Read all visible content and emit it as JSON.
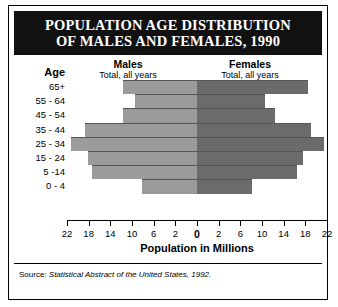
{
  "title": {
    "line1": "POPULATION AGE DISTRIBUTION",
    "line2": "OF MALES AND FEMALES, 1990"
  },
  "headers": {
    "age": "Age",
    "males": {
      "title": "Males",
      "subtitle": "Total, all years",
      "value": "121,239"
    },
    "females": {
      "title": "Females",
      "subtitle": "Total, all years",
      "value": "127,470"
    }
  },
  "axis": {
    "title": "Population in Millions",
    "tick_labels": [
      "22",
      "18",
      "14",
      "10",
      "6",
      "2",
      "0",
      "2",
      "6",
      "10",
      "14",
      "18",
      "22"
    ]
  },
  "source": {
    "prefix": "Source: ",
    "italic": "Statistical Abstract of the United States, 1992."
  },
  "colors": {
    "male_bar": "#9b9b9b",
    "female_bar": "#6b6b6b",
    "banner": "#111111",
    "frame": "#000000"
  },
  "chart_data": {
    "type": "bar",
    "title": "POPULATION AGE DISTRIBUTION OF MALES AND FEMALES, 1990",
    "xlabel": "Population in Millions",
    "ylabel": "Age",
    "orientation": "horizontal-diverging",
    "xlim": [
      -22,
      22
    ],
    "xticks": [
      22,
      18,
      14,
      10,
      6,
      2,
      0,
      2,
      6,
      10,
      14,
      18,
      22
    ],
    "grid": false,
    "legend_position": "top",
    "categories": [
      "65+",
      "55 - 64",
      "45 - 54",
      "35 - 44",
      "25 - 34",
      "15 - 24",
      "5 -14",
      "0 - 4"
    ],
    "series": [
      {
        "name": "Males",
        "side": "left",
        "total": "121,239",
        "values": [
          12.5,
          10.5,
          12.5,
          19.0,
          21.4,
          18.5,
          17.8,
          9.3
        ]
      },
      {
        "name": "Females",
        "side": "right",
        "total": "127,470",
        "values": [
          18.7,
          11.5,
          13.2,
          19.3,
          21.5,
          18.0,
          17.0,
          9.3
        ]
      }
    ],
    "source": "Source: Statistical Abstract of the United States, 1992."
  }
}
